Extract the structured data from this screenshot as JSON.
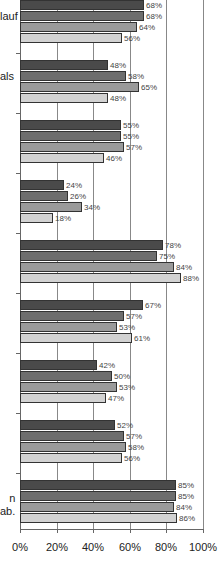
{
  "chart_data": {
    "type": "bar",
    "orientation": "horizontal",
    "title": "",
    "xlabel": "",
    "ylabel": "",
    "xlim": [
      0,
      100
    ],
    "x_ticks": [
      "0%",
      "20%",
      "40%",
      "60%",
      "80%",
      "100%"
    ],
    "grid": true,
    "categories": [
      "…lauf",
      "…als",
      "",
      "",
      "",
      "",
      "",
      "",
      "…n\n…ab."
    ],
    "series": [
      {
        "name": "Series 1",
        "color": "#4a4a4a",
        "values": [
          68,
          48,
          55,
          24,
          78,
          67,
          42,
          52,
          85
        ]
      },
      {
        "name": "Series 2",
        "color": "#6e6e6e",
        "values": [
          68,
          58,
          55,
          26,
          75,
          57,
          50,
          57,
          85
        ]
      },
      {
        "name": "Series 3",
        "color": "#9a9a9a",
        "values": [
          64,
          65,
          57,
          34,
          84,
          53,
          53,
          58,
          84
        ]
      },
      {
        "name": "Series 4",
        "color": "#d2d2d2",
        "values": [
          56,
          48,
          46,
          18,
          88,
          61,
          47,
          56,
          86
        ]
      }
    ],
    "group_tops": [
      0,
      60,
      120,
      180,
      240,
      300,
      360,
      420,
      480
    ],
    "category_label_y": [
      10,
      70,
      null,
      null,
      null,
      null,
      null,
      null,
      492
    ],
    "px_per_percent": 1.83,
    "zero_x": 20
  }
}
